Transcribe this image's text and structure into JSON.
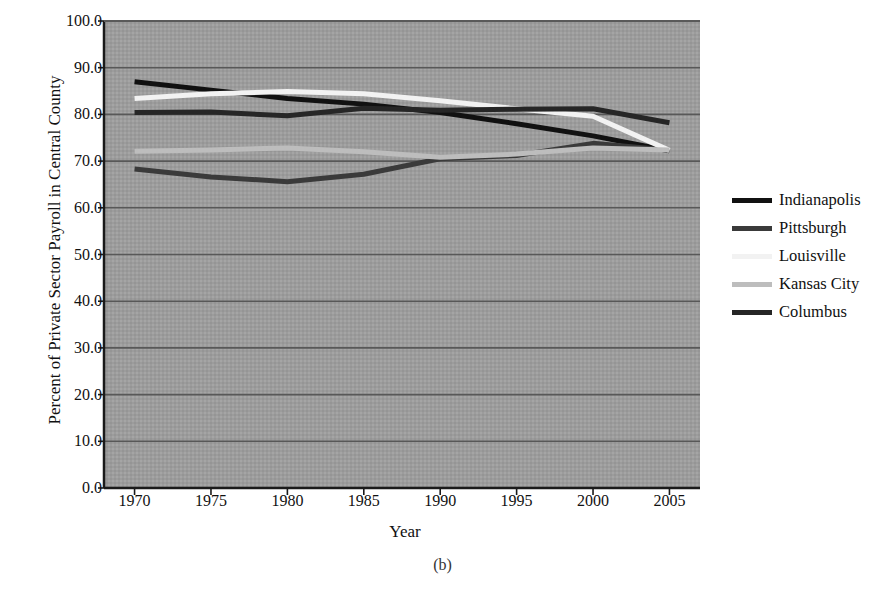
{
  "caption": "(b)",
  "chart_data": {
    "type": "line",
    "title": "",
    "xlabel": "Year",
    "ylabel": "Percent of Private Sector Payroll in Central County",
    "x": [
      1970,
      1975,
      1980,
      1985,
      1990,
      1995,
      2000,
      2005
    ],
    "xticklabels": [
      "1970",
      "1975",
      "1980",
      "1985",
      "1990",
      "1995",
      "2000",
      "2005"
    ],
    "yticklabels": [
      "0.0",
      "10.0",
      "20.0",
      "30.0",
      "40.0",
      "50.0",
      "60.0",
      "70.0",
      "80.0",
      "90.0",
      "100.0"
    ],
    "ytickvalues": [
      0,
      10,
      20,
      30,
      40,
      50,
      60,
      70,
      80,
      90,
      100
    ],
    "xlim": [
      1968,
      2007
    ],
    "ylim": [
      0,
      100
    ],
    "grid": true,
    "grid_axis": "y",
    "legend_position": "right",
    "plot_background": "#9e9e9e",
    "series": [
      {
        "name": "Indianapolis",
        "color": "#111111",
        "values": [
          87.0,
          85.2,
          83.4,
          82.2,
          80.4,
          78.0,
          75.4,
          72.2
        ]
      },
      {
        "name": "Pittsburgh",
        "color": "#3a3a3a",
        "values": [
          68.3,
          66.6,
          65.6,
          67.2,
          70.5,
          71.2,
          73.8,
          72.3
        ]
      },
      {
        "name": "Louisville",
        "color": "#f2f2f2",
        "values": [
          83.4,
          84.4,
          84.9,
          84.4,
          82.9,
          81.2,
          79.6,
          72.3
        ]
      },
      {
        "name": "Kansas City",
        "color": "#bdbdbd",
        "values": [
          72.1,
          72.4,
          72.8,
          72.0,
          70.8,
          71.5,
          72.8,
          72.4
        ]
      },
      {
        "name": "Columbus",
        "color": "#262626",
        "values": [
          80.4,
          80.5,
          79.7,
          81.3,
          80.9,
          81.1,
          81.2,
          78.2
        ]
      }
    ]
  }
}
